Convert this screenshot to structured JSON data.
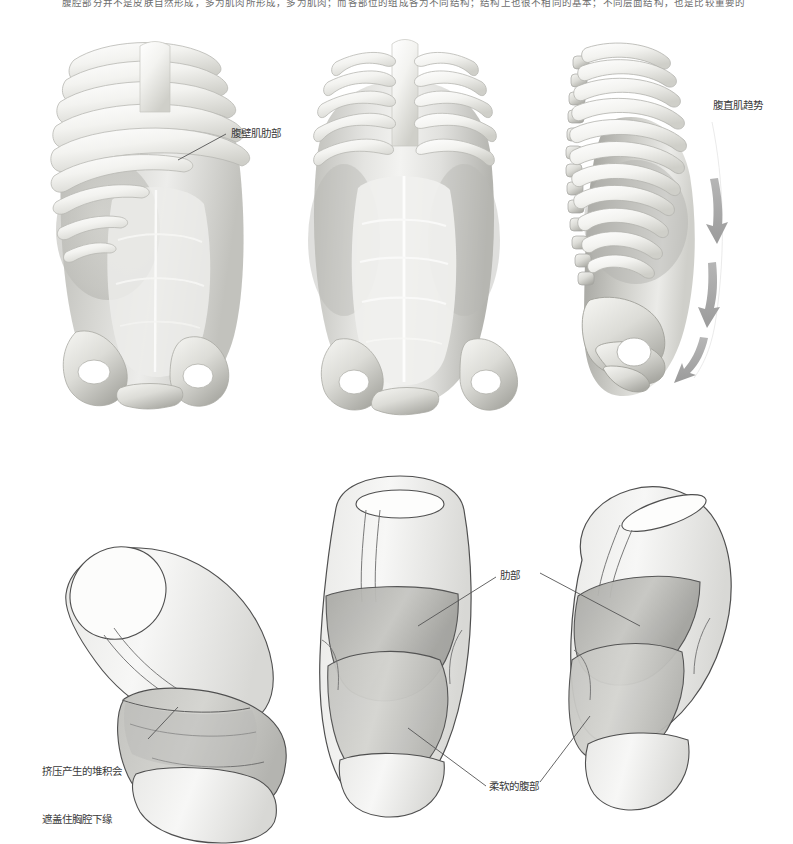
{
  "page": {
    "header_note": "腹腔部分并不是皮肤自然形成，多为肌肉所形成，多为肌肉；而各部位的组成各为不同结构；结构上也很不相同的基本；不同层面结构，也是比较重要的"
  },
  "figures": {
    "top_row": {
      "caption_group": "腹壁与肋骨结构三视图",
      "views": [
        {
          "name": "three-quarter-view",
          "description": "肋骨与腹壁肌三分之四视图"
        },
        {
          "name": "front-view",
          "description": "腹直肌正面视图"
        },
        {
          "name": "side-view",
          "description": "肋骨与骨盆侧面视图"
        }
      ]
    },
    "bottom_row": {
      "caption_group": "简化体块示意图",
      "views": [
        {
          "name": "tilted-cylinder-view",
          "description": "倾斜圆柱体块挤压示意"
        },
        {
          "name": "simplified-front-view",
          "description": "简化胸腔与腹部体块正面"
        },
        {
          "name": "simplified-tilted-view",
          "description": "简化胸腔与腹部体块倾斜"
        }
      ]
    }
  },
  "labels": {
    "abdominal_rib": "腹壁肌肋部",
    "rectus_trend": "腹直肌趋势",
    "compression_line1": "挤压产生的堆积会",
    "compression_line2": "遮盖住胸腔下缘",
    "rib_section": "肋部",
    "soft_abdomen": "柔软的腹部"
  },
  "colors": {
    "page_background": "#ffffff",
    "bone_light": "#f2f2f0",
    "bone_mid": "#d6d6d2",
    "bone_shadow": "#9a9a96",
    "muscle_light": "#e3e3e0",
    "muscle_mid": "#c9c9c5",
    "muscle_dark": "#a9a9a4",
    "arrow_gray": "#a8a8a8",
    "outline": "#4a4a4a",
    "label_text": "#3a3a3a",
    "leader_line": "#555555"
  },
  "arrows": {
    "count": 3,
    "direction": "downward",
    "meaning": "腹直肌趋势"
  }
}
